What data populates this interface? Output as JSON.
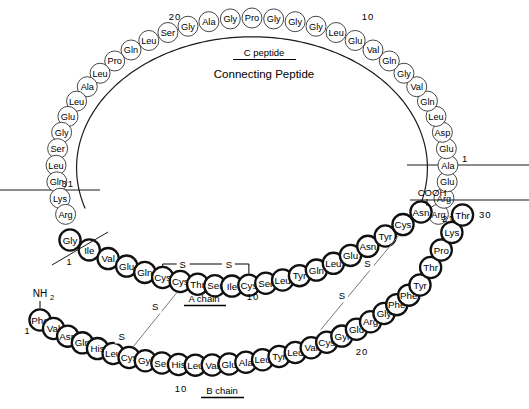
{
  "diagram": {
    "labels": {
      "c_peptide": "C peptide",
      "connecting_peptide": "Connecting Peptide",
      "a_chain": "A chain",
      "b_chain": "B chain",
      "n_terminus": "NH",
      "n_terminus_sub": "2",
      "c_terminus": "COOH",
      "s_label": "S"
    },
    "numbers": {
      "c_peptide_10": "10",
      "c_peptide_20": "20",
      "c_peptide_31": "31",
      "c_peptide_1": "1",
      "a_chain_1": "1",
      "a_chain_10": "10",
      "a_chain_21": "21",
      "b_chain_1": "1",
      "b_chain_10": "10",
      "b_chain_20": "20",
      "b_chain_30": "30"
    },
    "colors": {
      "outline": "#1a1a1a",
      "fill": "#ffffff",
      "chain_stroke": "#111111",
      "cpeptide_stroke": "#333333",
      "disulfide": "#777777",
      "text": "#000000"
    },
    "c_peptide_residues": [
      "Arg",
      "Arg",
      "Glu",
      "Ala",
      "Glu",
      "Asp",
      "Leu",
      "Gln",
      "Val",
      "Gly",
      "Gln",
      "Val",
      "Glu",
      "Leu",
      "Gly",
      "Gly",
      "Gly",
      "Pro",
      "Gly",
      "Ala",
      "Gly",
      "Ser",
      "Leu",
      "Gln",
      "Pro",
      "Leu",
      "Ala",
      "Leu",
      "Glu",
      "Gly",
      "Ser",
      "Leu",
      "Gln",
      "Lys",
      "Arg"
    ],
    "a_chain_residues": [
      "Gly",
      "Ile",
      "Val",
      "Glu",
      "Gln",
      "Cys",
      "Cys",
      "Thr",
      "Ser",
      "Ile",
      "Cys",
      "Ser",
      "Leu",
      "Tyr",
      "Gln",
      "Leu",
      "Glu",
      "Asn",
      "Tyr",
      "Cys",
      "Asn"
    ],
    "b_chain_residues": [
      "Phe",
      "Val",
      "Asn",
      "Gln",
      "His",
      "Leu",
      "Cys",
      "Gyl",
      "Ser",
      "His",
      "Leu",
      "Val",
      "Glu",
      "Ala",
      "Leu",
      "Tyr",
      "Leu",
      "Val",
      "Cys",
      "Gyl",
      "Glu",
      "Arg",
      "Gly",
      "Phe",
      "Phe",
      "Tyr",
      "Thr",
      "Pro",
      "Lys",
      "Thr"
    ]
  }
}
